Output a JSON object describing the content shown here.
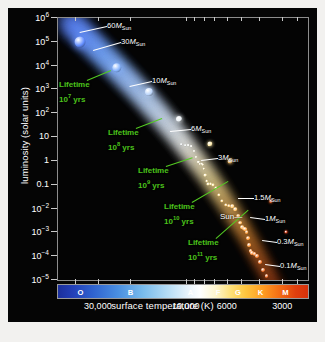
{
  "figure": {
    "xlabel": "surface temperature (K)",
    "ylabel": "luminosity (solar units)"
  },
  "chart_data": {
    "type": "scatter",
    "title": "",
    "xlabel": "surface temperature (K)",
    "ylabel": "luminosity (solar units)",
    "xscale": "log-reversed",
    "yscale": "log",
    "xlim": [
      50000,
      2200
    ],
    "ylim": [
      1e-05,
      1000000.0
    ],
    "grid": false,
    "legend": "none",
    "x_tick_labels": [
      "30,000",
      "10,000",
      "6000",
      "3000"
    ],
    "x_tick_values": [
      30000,
      10000,
      6000,
      3000
    ],
    "y_tick_labels": [
      "10⁶",
      "10⁵",
      "10⁴",
      "10³",
      "10²",
      "10",
      "1",
      "0.1",
      "10⁻²",
      "10⁻³",
      "10⁻⁴",
      "10⁻⁵"
    ],
    "y_tick_values": [
      1000000.0,
      100000.0,
      10000.0,
      1000.0,
      100.0,
      10,
      1,
      0.1,
      0.01,
      0.001,
      0.0001,
      1e-05
    ],
    "series": [
      {
        "name": "main sequence",
        "points": [
          {
            "mass": "60",
            "temperature": 44000,
            "luminosity": 800000
          },
          {
            "mass": "30",
            "temperature": 38000,
            "luminosity": 100000
          },
          {
            "mass": "10",
            "temperature": 24000,
            "luminosity": 8000
          },
          {
            "mass": "6",
            "temperature": 16000,
            "luminosity": 800
          },
          {
            "mass": "3",
            "temperature": 11000,
            "luminosity": 60
          },
          {
            "mass": "1.5",
            "temperature": 7500,
            "luminosity": 5
          },
          {
            "mass": "1",
            "temperature": 5800,
            "luminosity": 1
          },
          {
            "mass": "0.3",
            "temperature": 3500,
            "luminosity": 0.02
          },
          {
            "mass": "0.1",
            "temperature": 2900,
            "luminosity": 0.001
          }
        ]
      }
    ],
    "mass_annotations": [
      {
        "id": "m60",
        "value": "60",
        "unit": "M",
        "sub": "Sun"
      },
      {
        "id": "m30",
        "value": "30",
        "unit": "M",
        "sub": "Sun"
      },
      {
        "id": "m10",
        "value": "10",
        "unit": "M",
        "sub": "Sun"
      },
      {
        "id": "m6",
        "value": "6",
        "unit": "M",
        "sub": "Sun"
      },
      {
        "id": "m3",
        "value": "3",
        "unit": "M",
        "sub": "Sun"
      },
      {
        "id": "m15",
        "value": "1.5",
        "unit": "M",
        "sub": "Sun"
      },
      {
        "id": "m1",
        "value": "1",
        "unit": "M",
        "sub": "Sun"
      },
      {
        "id": "m03",
        "value": "0.3",
        "unit": "M",
        "sub": "Sun"
      },
      {
        "id": "m01",
        "value": "0.1",
        "unit": "M",
        "sub": "Sun"
      }
    ],
    "lifetime_annotations": [
      {
        "id": "lt7",
        "title": "Lifetime",
        "base": "10",
        "exp": "7",
        "unit": "yrs"
      },
      {
        "id": "lt8",
        "title": "Lifetime",
        "base": "10",
        "exp": "8",
        "unit": "yrs"
      },
      {
        "id": "lt9",
        "title": "Lifetime",
        "base": "10",
        "exp": "9",
        "unit": "yrs"
      },
      {
        "id": "lt10",
        "title": "Lifetime",
        "base": "10",
        "exp": "10",
        "unit": "yrs"
      },
      {
        "id": "lt11",
        "title": "Lifetime",
        "base": "10",
        "exp": "11",
        "unit": "yrs"
      }
    ],
    "sun_marker": {
      "label": "Sun",
      "dash": "—"
    },
    "spectral_classes": [
      {
        "letter": "O",
        "pos": 9
      },
      {
        "letter": "B",
        "pos": 29
      },
      {
        "letter": "A",
        "pos": 53
      },
      {
        "letter": "F",
        "pos": 64
      },
      {
        "letter": "G",
        "pos": 72
      },
      {
        "letter": "K",
        "pos": 81
      },
      {
        "letter": "M",
        "pos": 91
      }
    ],
    "colors": {
      "background": "#050505",
      "lifetime_green": "#4cc21c",
      "label_white": "#ffffff",
      "hot_blue": "#2340b8",
      "cool_red": "#d8310b"
    }
  }
}
